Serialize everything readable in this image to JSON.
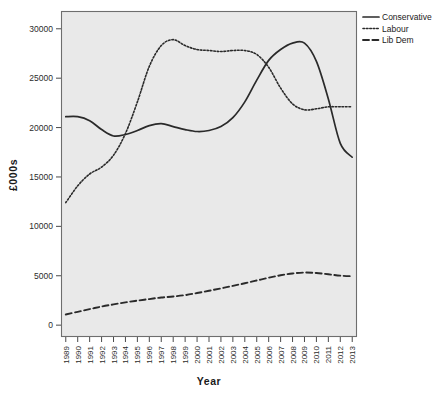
{
  "chart_data": {
    "type": "line",
    "title": "",
    "xlabel": "Year",
    "ylabel": "£000s",
    "x": [
      1989,
      1990,
      1991,
      1992,
      1993,
      1994,
      1995,
      1996,
      1997,
      1998,
      1999,
      2000,
      2001,
      2002,
      2003,
      2004,
      2005,
      2006,
      2007,
      2008,
      2009,
      2010,
      2011,
      2012,
      2013
    ],
    "xtick_labels": [
      "1989",
      "1990",
      "1991",
      "1992",
      "1993",
      "1994",
      "1995",
      "1996",
      "1997",
      "1998",
      "1999",
      "2000",
      "2001",
      "2002",
      "2003",
      "2004",
      "2005",
      "2006",
      "2007",
      "2008",
      "2009",
      "2010",
      "2011",
      "2012",
      "2013"
    ],
    "ytick_labels": [
      "0",
      "5000",
      "10000",
      "15000",
      "20000",
      "25000",
      "30000"
    ],
    "yticks": [
      0,
      5000,
      10000,
      15000,
      20000,
      25000,
      30000
    ],
    "ylim": [
      -1200,
      31800
    ],
    "xlim": [
      1988.6,
      2013.4
    ],
    "grid": false,
    "legend_position": "top-right",
    "series": [
      {
        "name": "Conservative",
        "style": "solid",
        "values": [
          21100,
          21100,
          20700,
          19800,
          19150,
          19300,
          19700,
          20200,
          20400,
          20100,
          19800,
          19600,
          19700,
          20100,
          21000,
          22600,
          24800,
          26800,
          27900,
          28550,
          28550,
          26700,
          22900,
          18400,
          17000
        ]
      },
      {
        "name": "Labour",
        "style": "dotted",
        "values": [
          12400,
          14100,
          15300,
          16000,
          17200,
          19400,
          22600,
          26200,
          28300,
          28900,
          28300,
          27900,
          27800,
          27700,
          27800,
          27800,
          27400,
          26100,
          24000,
          22400,
          21800,
          21900,
          22100,
          22100,
          22100
        ]
      },
      {
        "name": "Lib Dem",
        "style": "dashed",
        "values": [
          1080,
          1350,
          1620,
          1880,
          2100,
          2310,
          2480,
          2640,
          2800,
          2900,
          3040,
          3250,
          3480,
          3720,
          3980,
          4240,
          4520,
          4800,
          5050,
          5230,
          5320,
          5280,
          5150,
          5010,
          4950
        ]
      }
    ]
  },
  "legend": {
    "items": [
      {
        "label": "Conservative",
        "style": "solid"
      },
      {
        "label": "Labour",
        "style": "dotted"
      },
      {
        "label": "Lib Dem",
        "style": "dashed"
      }
    ]
  },
  "colors": {
    "plot_background": "#e9e9e9",
    "page_background": "#ffffff",
    "line": "#2a2a2a",
    "border": "#6e6e6e"
  }
}
